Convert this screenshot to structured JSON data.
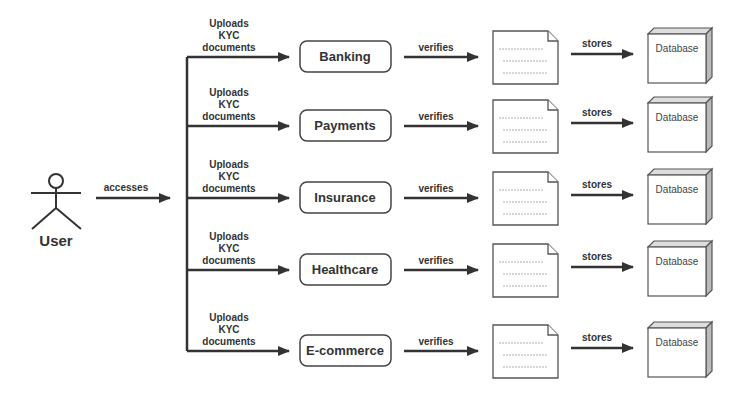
{
  "actor": {
    "label": "User",
    "edge_label": "accesses"
  },
  "rows": [
    {
      "upload_label": [
        "Uploads",
        "KYC",
        "documents"
      ],
      "service": "Banking",
      "verify_label": "verifies",
      "store_label": "stores",
      "db_label": "Database",
      "y": 57
    },
    {
      "upload_label": [
        "Uploads",
        "KYC",
        "documents"
      ],
      "service": "Payments",
      "verify_label": "verifies",
      "store_label": "stores",
      "db_label": "Database",
      "y": 126
    },
    {
      "upload_label": [
        "Uploads",
        "KYC",
        "documents"
      ],
      "service": "Insurance",
      "verify_label": "verifies",
      "store_label": "stores",
      "db_label": "Database",
      "y": 198
    },
    {
      "upload_label": [
        "Uploads",
        "KYC",
        "documents"
      ],
      "service": "Healthcare",
      "verify_label": "verifies",
      "store_label": "stores",
      "db_label": "Database",
      "y": 270
    },
    {
      "upload_label": [
        "Uploads",
        "KYC",
        "documents"
      ],
      "service": "E-commerce",
      "verify_label": "verifies",
      "store_label": "stores",
      "db_label": "Database",
      "y": 351
    }
  ],
  "colors": {
    "stroke": "#333333",
    "db_shade": "#bbbbbb",
    "background": "#ffffff"
  }
}
